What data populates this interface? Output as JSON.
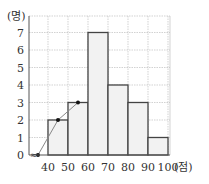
{
  "chart_data": {
    "type": "bar",
    "subtype": "histogram_with_frequency_polygon",
    "title": "",
    "xlabel": "(점)",
    "ylabel": "(명)",
    "x_ticks": [
      "40",
      "50",
      "60",
      "70",
      "80",
      "90",
      "100"
    ],
    "y_ticks": [
      "0",
      "1",
      "2",
      "3",
      "4",
      "5",
      "6",
      "7"
    ],
    "ylim": [
      0,
      7.5
    ],
    "xlim": [
      30,
      100
    ],
    "grid": true,
    "bins": [
      {
        "from": 40,
        "to": 50,
        "value": 2
      },
      {
        "from": 50,
        "to": 60,
        "value": 3
      },
      {
        "from": 60,
        "to": 70,
        "value": 7
      },
      {
        "from": 70,
        "to": 80,
        "value": 4
      },
      {
        "from": 80,
        "to": 90,
        "value": 3
      },
      {
        "from": 90,
        "to": 100,
        "value": 1
      }
    ],
    "categories": [
      "40-50",
      "50-60",
      "60-70",
      "70-80",
      "80-90",
      "90-100"
    ],
    "values": [
      2,
      3,
      7,
      4,
      3,
      1
    ],
    "polygon_points_shown": [
      {
        "x": 35,
        "y": 0
      },
      {
        "x": 45,
        "y": 2
      },
      {
        "x": 55,
        "y": 3
      }
    ],
    "axis_break_symbol": "≈"
  },
  "labels": {
    "y_unit": "(명)",
    "x_unit": "(점)",
    "zero": "0"
  },
  "colors": {
    "bar_fill": "#f2f2f2",
    "bar_stroke": "#444444",
    "grid": "#bfbfbf",
    "axis": "#555555",
    "polygon": "#888888",
    "point": "#111111"
  }
}
